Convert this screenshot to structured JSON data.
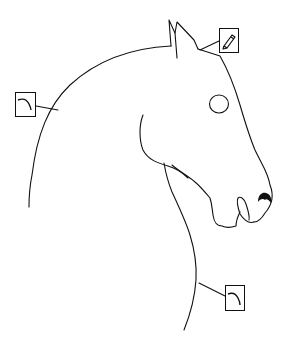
{
  "diagram": {
    "stroke_color": "#111111",
    "background": "#ffffff",
    "callouts": [
      {
        "id": "pencil",
        "icon": "pencil-icon",
        "box": {
          "x": 219,
          "y": 28,
          "w": 20,
          "h": 25
        },
        "leader_to": {
          "x": 200,
          "y": 50
        }
      },
      {
        "id": "curve-left",
        "icon": "curve-icon",
        "box": {
          "x": 15,
          "y": 92,
          "w": 21,
          "h": 25
        },
        "leader_to": {
          "x": 58,
          "y": 110
        }
      },
      {
        "id": "curve-bottom",
        "icon": "curve-icon",
        "box": {
          "x": 225,
          "y": 285,
          "w": 20,
          "h": 26
        },
        "leader_to": {
          "x": 199,
          "y": 283
        }
      }
    ]
  }
}
